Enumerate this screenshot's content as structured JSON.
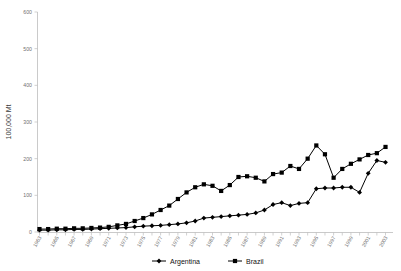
{
  "chart_data": {
    "type": "line",
    "title": "",
    "xlabel": "",
    "ylabel": "100,000 Mt",
    "ylim": [
      0,
      600
    ],
    "yticks": [
      0,
      100,
      200,
      300,
      400,
      500,
      600
    ],
    "grid": false,
    "legend_position": "bottom",
    "x": [
      1963,
      1964,
      1965,
      1966,
      1967,
      1968,
      1969,
      1970,
      1971,
      1972,
      1973,
      1974,
      1975,
      1976,
      1977,
      1978,
      1979,
      1980,
      1981,
      1982,
      1983,
      1984,
      1985,
      1986,
      1987,
      1988,
      1989,
      1990,
      1991,
      1992,
      1993,
      1994,
      1995,
      1996,
      1997,
      1998,
      1999,
      2000,
      2001,
      2002,
      2003
    ],
    "xtick_labels": [
      "1963",
      "1965",
      "1967",
      "1969",
      "1971",
      "1973",
      "1975",
      "1977",
      "1979",
      "1981",
      "1983",
      "1985",
      "1987",
      "1989",
      "1991",
      "1993",
      "1995",
      "1997",
      "1999",
      "2001",
      "2003"
    ],
    "series": [
      {
        "name": "Argentina",
        "marker": "plus-diamond",
        "color": "#000000",
        "values": [
          5,
          5,
          6,
          6,
          7,
          7,
          8,
          9,
          10,
          11,
          12,
          14,
          16,
          17,
          18,
          20,
          22,
          25,
          30,
          38,
          40,
          42,
          44,
          46,
          48,
          52,
          60,
          75,
          80,
          72,
          78,
          80,
          118,
          120,
          120,
          122,
          122,
          108,
          160,
          195,
          190
        ]
      },
      {
        "name": "Brazil",
        "marker": "square",
        "color": "#000000",
        "values": [
          8,
          8,
          9,
          9,
          10,
          10,
          11,
          12,
          14,
          18,
          22,
          30,
          38,
          48,
          60,
          72,
          90,
          108,
          122,
          130,
          126,
          112,
          128,
          150,
          152,
          148,
          138,
          158,
          162,
          180,
          172,
          200,
          236,
          212,
          148,
          172,
          186,
          198,
          210,
          215,
          232
        ]
      }
    ]
  },
  "legend": {
    "items": [
      {
        "label": "Argentina",
        "marker": "plus-diamond"
      },
      {
        "label": "Brazil",
        "marker": "square"
      }
    ]
  },
  "axes": {
    "y_axis_title": "100,000 Mt"
  }
}
